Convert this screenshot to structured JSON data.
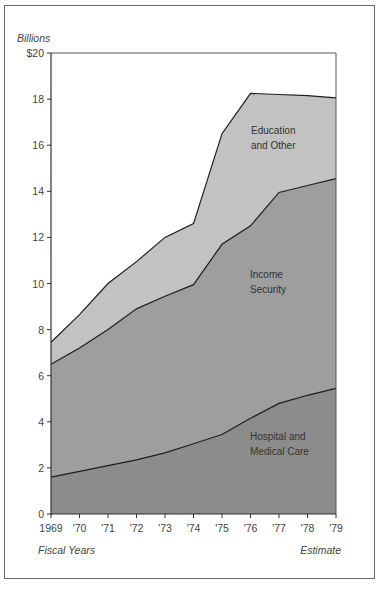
{
  "chart_data": {
    "type": "area",
    "stacked": true,
    "title": "",
    "ylabel": "Billions",
    "xlabel": "Fiscal Years",
    "annotation_right": "Estimate",
    "ylim": [
      0,
      20
    ],
    "yticks": [
      0,
      2,
      4,
      6,
      8,
      10,
      12,
      14,
      16,
      18,
      20
    ],
    "ytick_labels": [
      "0",
      "2",
      "4",
      "6",
      "8",
      "10",
      "12",
      "14",
      "16",
      "18",
      "$20"
    ],
    "categories": [
      "1969",
      "'70",
      "'71",
      "'72",
      "'73",
      "'74",
      "'75",
      "'76",
      "'77",
      "'78",
      "'79"
    ],
    "series": [
      {
        "name": "Hospital and Medical Care",
        "label_lines": [
          "Hospital and",
          "Medical Care"
        ],
        "color": "#8c8c8c",
        "values": [
          1.6,
          1.85,
          2.1,
          2.35,
          2.65,
          3.05,
          3.45,
          4.15,
          4.8,
          5.15,
          5.45
        ]
      },
      {
        "name": "Income Security",
        "label_lines": [
          "Income",
          "Security"
        ],
        "color": "#9e9e9e",
        "values": [
          4.9,
          5.35,
          5.9,
          6.55,
          6.8,
          6.9,
          8.25,
          8.35,
          9.15,
          9.1,
          9.1
        ]
      },
      {
        "name": "Education and Other",
        "label_lines": [
          "Education",
          "and Other"
        ],
        "color": "#c2c2c2",
        "values": [
          0.95,
          1.45,
          2.0,
          2.05,
          2.55,
          2.65,
          4.8,
          5.75,
          4.25,
          3.9,
          3.5
        ]
      }
    ],
    "cumulative_totals": {
      "hospital": [
        1.6,
        1.85,
        2.1,
        2.35,
        2.65,
        3.05,
        3.45,
        4.15,
        4.8,
        5.15,
        5.45
      ],
      "hospital_plus_income": [
        6.5,
        7.2,
        8.0,
        8.9,
        9.45,
        9.95,
        11.7,
        12.5,
        13.95,
        14.25,
        14.55
      ],
      "total": [
        7.45,
        8.65,
        10.0,
        10.95,
        12.0,
        12.6,
        16.5,
        18.25,
        18.2,
        18.15,
        18.05
      ]
    },
    "grid": false,
    "legend": "inline labels"
  }
}
